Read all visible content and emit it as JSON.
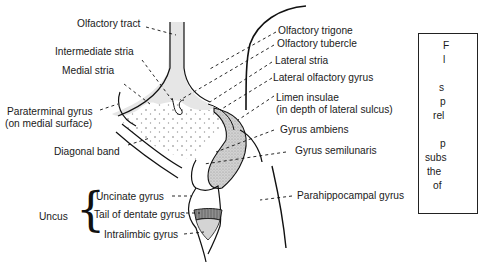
{
  "figure": {
    "type": "anatomical diagram",
    "colors": {
      "line": "#111111",
      "shade_light": "#e6e6e6",
      "shade_stipple": "#cfcfcf",
      "shade_dark": "#9a9a9a",
      "background": "#ffffff"
    }
  },
  "labels_left": {
    "olfactory_tract": "Olfactory tract",
    "intermediate_stria": "Intermediate stria",
    "medial_stria": "Medial stria",
    "paraterminal_gyrus": "Paraterminal gyrus",
    "paraterminal_gyrus_note": "(on medial surface)",
    "diagonal_band": "Diagonal band"
  },
  "uncus_group": {
    "title": "Uncus",
    "items": [
      "Uncinate gyrus",
      "Tail of dentate gyrus",
      "Intralimbic gyrus"
    ]
  },
  "labels_right": {
    "olfactory_trigone": "Olfactory trigone",
    "olfactory_tubercle": "Olfactory tubercle",
    "lateral_stria": "Lateral stria",
    "lateral_olfactory_gyrus": "Lateral olfactory gyrus",
    "limen_insulae": "Limen insulae",
    "limen_insulae_note": "(in depth of lateral sulcus)",
    "gyrus_ambiens": "Gyrus ambiens",
    "gyrus_semilunaris": "Gyrus semilunaris",
    "parahippocampal_gyrus": "Parahippocampal gyrus"
  },
  "side_box": {
    "visible_fragments": [
      "F",
      "l",
      "",
      "s",
      "p",
      "rel",
      "",
      "p",
      "subs",
      "the",
      "of"
    ]
  }
}
